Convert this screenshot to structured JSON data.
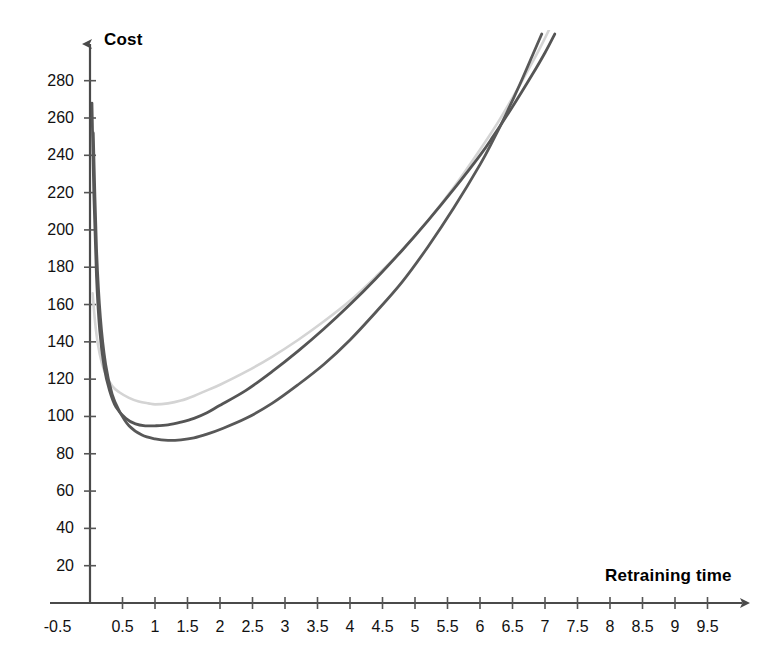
{
  "chart_data": {
    "type": "line",
    "title": "",
    "xlabel": "Retraining time",
    "ylabel": "Cost",
    "xlim": [
      -0.5,
      9.9
    ],
    "ylim": [
      0,
      295
    ],
    "grid": false,
    "legend": "none",
    "x_ticks": [
      "-0.5",
      "0.5",
      "1",
      "1.5",
      "2",
      "2.5",
      "3",
      "3.5",
      "4",
      "4.5",
      "5",
      "5.5",
      "6",
      "6.5",
      "7",
      "7.5",
      "8",
      "8.5",
      "9",
      "9.5"
    ],
    "x_tick_values": [
      -0.5,
      0.5,
      1,
      1.5,
      2,
      2.5,
      3,
      3.5,
      4,
      4.5,
      5,
      5.5,
      6,
      6.5,
      7,
      7.5,
      8,
      8.5,
      9,
      9.5
    ],
    "y_ticks": [
      "20",
      "40",
      "60",
      "80",
      "100",
      "120",
      "140",
      "160",
      "180",
      "200",
      "220",
      "240",
      "260",
      "280"
    ],
    "y_tick_values": [
      20,
      40,
      60,
      80,
      100,
      120,
      140,
      160,
      180,
      200,
      220,
      240,
      260,
      280
    ],
    "axis_color": "#555555",
    "series": [
      {
        "name": "light-curve",
        "color": "#d4d4d4",
        "width": 2.6,
        "x": [
          0.04,
          0.08,
          0.12,
          0.18,
          0.25,
          0.35,
          0.45,
          0.6,
          0.75,
          0.9,
          1.0,
          1.2,
          1.4,
          1.6,
          1.8,
          2.0,
          2.4,
          2.8,
          3.2,
          3.6,
          4.0,
          4.4,
          4.8,
          5.2,
          5.6,
          6.0,
          6.3,
          6.6,
          6.9,
          7.1
        ],
        "y": [
          166,
          150,
          139,
          129,
          122,
          116,
          113,
          110,
          108,
          107,
          106.5,
          107,
          108.5,
          111,
          114,
          117,
          124,
          132,
          141,
          151,
          162,
          175,
          189,
          205,
          223,
          243,
          259,
          277,
          296,
          310
        ]
      },
      {
        "name": "mid-dark-curve",
        "color": "#555555",
        "width": 2.8,
        "x": [
          0.03,
          0.06,
          0.1,
          0.15,
          0.22,
          0.3,
          0.4,
          0.55,
          0.7,
          0.85,
          1.0,
          1.2,
          1.4,
          1.6,
          1.8,
          2.0,
          2.4,
          2.8,
          3.2,
          3.6,
          4.0,
          4.4,
          4.8,
          5.2,
          5.6,
          6.0,
          6.2,
          6.5,
          6.8,
          7.0,
          7.15
        ],
        "y": [
          268,
          218,
          175,
          146,
          126,
          114,
          105,
          99,
          96,
          95,
          95,
          95.5,
          97,
          99,
          102,
          106,
          114,
          124,
          135,
          147,
          160,
          174,
          189,
          205,
          222,
          240,
          250,
          266,
          283,
          295,
          305
        ]
      },
      {
        "name": "low-dark-curve",
        "color": "#585858",
        "width": 2.8,
        "x": [
          0.05,
          0.1,
          0.16,
          0.24,
          0.34,
          0.45,
          0.6,
          0.8,
          1.0,
          1.2,
          1.4,
          1.6,
          1.8,
          2.0,
          2.4,
          2.8,
          3.2,
          3.6,
          4.0,
          4.4,
          4.8,
          5.2,
          5.6,
          6.0,
          6.2,
          6.4,
          6.6,
          6.8,
          6.95
        ],
        "y": [
          252,
          190,
          153,
          128,
          112,
          103,
          95,
          90,
          88,
          87.2,
          87.5,
          88.5,
          90.5,
          93,
          99,
          107,
          117,
          128,
          141,
          156,
          172,
          191,
          212,
          235,
          248,
          262,
          277,
          293,
          305
        ]
      }
    ]
  },
  "geometry": {
    "origin_x": 90,
    "origin_y": 603,
    "px_per_x_unit": 65.0,
    "px_per_y_unit": 1.8654,
    "y_axis_top": 37,
    "x_axis_right": 750
  }
}
